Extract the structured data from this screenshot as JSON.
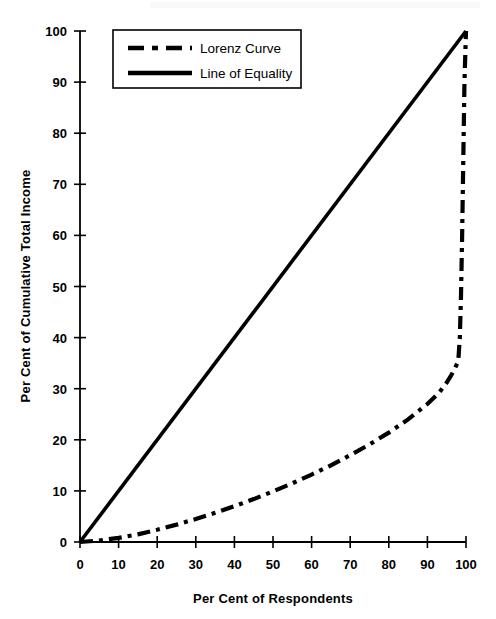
{
  "chart_data": {
    "type": "line",
    "title": "",
    "xlabel": "Per Cent of Respondents",
    "ylabel": "Per Cent of Cumulative Total Income",
    "xlim": [
      0,
      100
    ],
    "ylim": [
      0,
      100
    ],
    "xticks": [
      0,
      10,
      20,
      30,
      40,
      50,
      60,
      70,
      80,
      90,
      100
    ],
    "yticks": [
      0,
      10,
      20,
      30,
      40,
      50,
      60,
      70,
      80,
      90,
      100
    ],
    "grid": false,
    "legend_position": "upper-left",
    "series": [
      {
        "name": "Lorenz Curve",
        "style": "dash-dot",
        "color": "#000000",
        "x": [
          0,
          5,
          10,
          15,
          20,
          25,
          30,
          35,
          40,
          45,
          50,
          55,
          60,
          65,
          70,
          75,
          80,
          85,
          90,
          93,
          95,
          96,
          97,
          98,
          98.4,
          98.7,
          99,
          99.3,
          99.6,
          100
        ],
        "y": [
          0,
          0.3,
          0.8,
          1.5,
          2.4,
          3.4,
          4.5,
          5.7,
          7.0,
          8.4,
          9.9,
          11.5,
          13.2,
          15.0,
          17.0,
          19.1,
          21.4,
          24.0,
          27.0,
          29.2,
          31.2,
          32.4,
          33.8,
          35.4,
          40.0,
          48.0,
          60.0,
          75.0,
          90.0,
          100
        ]
      },
      {
        "name": "Line of Equality",
        "style": "solid",
        "color": "#000000",
        "x": [
          0,
          100
        ],
        "y": [
          0,
          100
        ]
      }
    ]
  },
  "legend": {
    "items": [
      {
        "label": "Lorenz Curve",
        "style": "dash-dot"
      },
      {
        "label": "Line of Equality",
        "style": "solid"
      }
    ]
  },
  "axes": {
    "x_title": "Per Cent of Respondents",
    "y_title": "Per Cent of Cumulative Total Income",
    "x_tick_labels": [
      "0",
      "10",
      "20",
      "30",
      "40",
      "50",
      "60",
      "70",
      "80",
      "90",
      "100"
    ],
    "y_tick_labels": [
      "0",
      "10",
      "20",
      "30",
      "40",
      "50",
      "60",
      "70",
      "80",
      "90",
      "100"
    ]
  },
  "colors": {
    "ink": "#000000",
    "background": "#ffffff"
  }
}
